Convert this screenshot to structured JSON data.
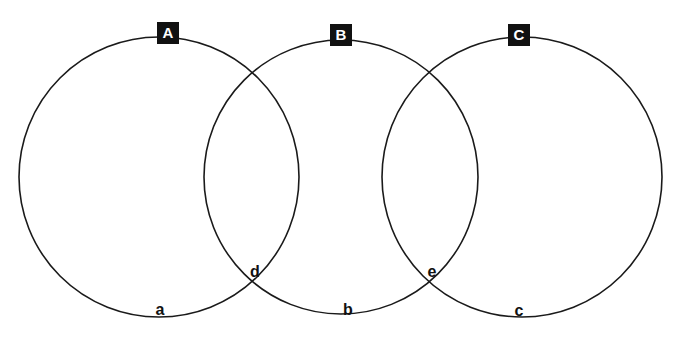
{
  "diagram": {
    "type": "venn",
    "title": "",
    "background_color": "#ffffff",
    "stroke_color": "#1a1a1a",
    "stroke_width": 1.6,
    "badge_background": "#111111",
    "badge_text_color": "#ffffff",
    "label_color": "#111111",
    "circles": [
      {
        "id": "A",
        "label": "A",
        "cx": 159,
        "cy": 177,
        "r": 140
      },
      {
        "id": "B",
        "label": "B",
        "cx": 341,
        "cy": 177,
        "r": 137
      },
      {
        "id": "C",
        "label": "C",
        "cx": 522,
        "cy": 177,
        "r": 140
      }
    ],
    "set_badges": [
      {
        "label": "A",
        "x": 168,
        "y": 33
      },
      {
        "label": "B",
        "x": 341,
        "y": 35
      },
      {
        "label": "C",
        "x": 519,
        "y": 35
      }
    ],
    "region_labels": [
      {
        "label": "a",
        "x": 160,
        "y": 310
      },
      {
        "label": "d",
        "x": 255,
        "y": 272
      },
      {
        "label": "b",
        "x": 348,
        "y": 310
      },
      {
        "label": "e",
        "x": 432,
        "y": 272
      },
      {
        "label": "c",
        "x": 519,
        "y": 311
      }
    ]
  }
}
